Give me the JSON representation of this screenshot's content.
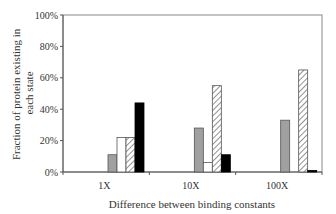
{
  "chart_data": {
    "type": "bar",
    "title": "",
    "xlabel": "Difference between binding constants",
    "ylabel": "Fraction of protein existing in each state",
    "ylabel_lines": [
      "Fraction of protein existing in",
      "each state"
    ],
    "categories": [
      "1X",
      "10X",
      "100X"
    ],
    "yticks": [
      "0%",
      "20%",
      "40%",
      "60%",
      "80%",
      "100%"
    ],
    "ylim": [
      0,
      100
    ],
    "grid": false,
    "legend": null,
    "series": [
      {
        "name": "gray",
        "fill": "#a0a0a0",
        "pattern": "solid",
        "values": [
          11,
          28,
          33
        ]
      },
      {
        "name": "white",
        "fill": "#ffffff",
        "pattern": "solid",
        "values": [
          22,
          6,
          0
        ]
      },
      {
        "name": "hatched",
        "fill": "#ffffff",
        "pattern": "diagonal-hatch",
        "values": [
          22,
          55,
          65
        ]
      },
      {
        "name": "black",
        "fill": "#000000",
        "pattern": "solid",
        "values": [
          44,
          11,
          1
        ]
      }
    ]
  }
}
